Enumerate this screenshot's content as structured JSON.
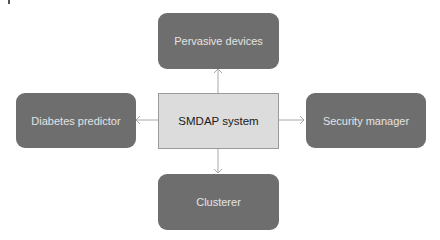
{
  "diagram": {
    "center": {
      "label": "SMDAP system",
      "fill": "#dcdcdc"
    },
    "nodes": {
      "top": {
        "label": "Pervasive devices",
        "fill": "#6e6e6e"
      },
      "left": {
        "label": "Diabetes predictor",
        "fill": "#6e6e6e"
      },
      "right": {
        "label": "Security manager",
        "fill": "#6e6e6e"
      },
      "bottom": {
        "label": "Clusterer",
        "fill": "#6e6e6e"
      }
    },
    "edges": [
      {
        "from": "SMDAP system",
        "to": "Pervasive devices"
      },
      {
        "from": "SMDAP system",
        "to": "Diabetes predictor"
      },
      {
        "from": "SMDAP system",
        "to": "Security manager"
      },
      {
        "from": "SMDAP system",
        "to": "Clusterer"
      }
    ],
    "edge_color": "#a8a8a8"
  }
}
